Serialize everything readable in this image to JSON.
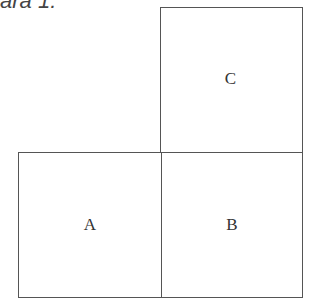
{
  "caption": "ara 1:",
  "diagram": {
    "boxes": [
      {
        "id": "A",
        "label": "A",
        "position": "bottom-left"
      },
      {
        "id": "B",
        "label": "B",
        "position": "bottom-right"
      },
      {
        "id": "C",
        "label": "C",
        "position": "top-right"
      }
    ]
  }
}
